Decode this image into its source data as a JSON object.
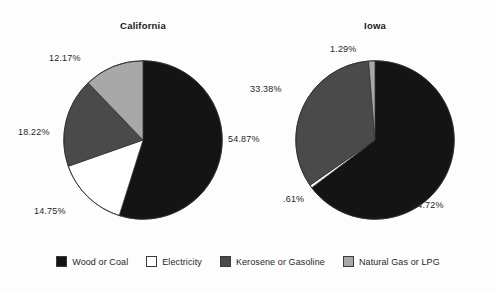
{
  "chart_data": {
    "type": "pie",
    "title": "",
    "legend_position": "bottom",
    "categories": [
      "Wood or Coal",
      "Electricity",
      "Kerosene or Gasoline",
      "Natural Gas or LPG"
    ],
    "colors": [
      "#141414",
      "#ffffff",
      "#4a4a4a",
      "#a8a8a8"
    ],
    "charts": [
      {
        "title": "California",
        "values": [
          54.87,
          14.75,
          18.22,
          12.17
        ],
        "labels": [
          "54.87%",
          "14.75%",
          "18.22%",
          "12.17%"
        ],
        "start_angle_deg": 0,
        "direction": "clockwise"
      },
      {
        "title": "Iowa",
        "values": [
          64.72,
          0.61,
          33.38,
          1.29
        ],
        "labels": [
          "64.72%",
          ".61%",
          "33.38%",
          "1.29%"
        ],
        "start_angle_deg": 0,
        "direction": "clockwise"
      }
    ]
  },
  "legend": {
    "items": [
      {
        "label": "Wood or Coal",
        "color": "#141414"
      },
      {
        "label": "Electricity",
        "color": "#ffffff"
      },
      {
        "label": "Kerosene or Gasoline",
        "color": "#4a4a4a"
      },
      {
        "label": "Natural Gas or LPG",
        "color": "#a8a8a8"
      }
    ]
  }
}
